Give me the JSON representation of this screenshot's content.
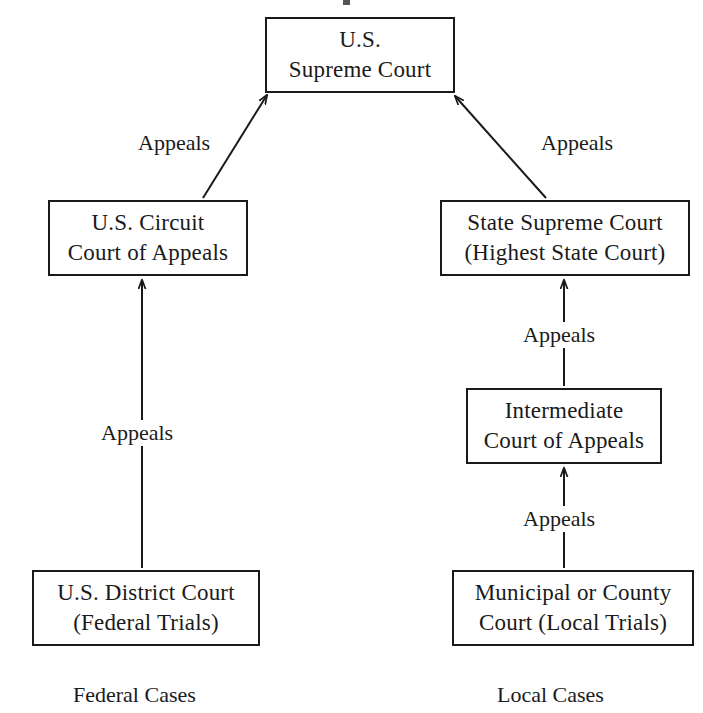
{
  "diagram": {
    "background_color": "#ffffff",
    "line_color": "#1a1a1a",
    "text_color": "#1a1a1a",
    "nodes": [
      {
        "id": "us-supreme-court",
        "line1": "U.S.",
        "line2": "Supreme Court",
        "x": 265,
        "y": 17,
        "w": 190,
        "h": 76
      },
      {
        "id": "us-circuit-court-of-appeals",
        "line1": "U.S. Circuit",
        "line2": "Court of Appeals",
        "x": 48,
        "y": 200,
        "w": 200,
        "h": 76
      },
      {
        "id": "state-supreme-court",
        "line1": "State Supreme Court",
        "line2": "(Highest State Court)",
        "x": 440,
        "y": 200,
        "w": 250,
        "h": 76
      },
      {
        "id": "intermediate-court-of-appeals",
        "line1": "Intermediate",
        "line2": "Court of Appeals",
        "x": 466,
        "y": 388,
        "w": 196,
        "h": 76
      },
      {
        "id": "us-district-court",
        "line1": "U.S. District Court",
        "line2": "(Federal Trials)",
        "x": 32,
        "y": 570,
        "w": 228,
        "h": 76
      },
      {
        "id": "municipal-or-county-court",
        "line1": "Municipal or County",
        "line2": "Court (Local Trials)",
        "x": 452,
        "y": 570,
        "w": 242,
        "h": 76
      }
    ],
    "edges": [
      {
        "id": "circuit-to-supreme",
        "label": "Appeals",
        "from": "us-circuit-court-of-appeals",
        "to": "us-supreme-court",
        "x1": 203,
        "y1": 198,
        "x2": 267,
        "y2": 95,
        "label_x": 133,
        "label_y": 130
      },
      {
        "id": "state-supreme-to-supreme",
        "label": "Appeals",
        "from": "state-supreme-court",
        "to": "us-supreme-court",
        "x1": 546,
        "y1": 198,
        "x2": 455,
        "y2": 96,
        "label_x": 536,
        "label_y": 130
      },
      {
        "id": "district-to-circuit",
        "label": "Appeals",
        "from": "us-district-court",
        "to": "us-circuit-court-of-appeals",
        "x1": 142,
        "y1": 568,
        "x2": 142,
        "y2": 280,
        "label_x": 96,
        "label_y": 420
      },
      {
        "id": "intermediate-to-state-supreme",
        "label": "Appeals",
        "from": "intermediate-court-of-appeals",
        "to": "state-supreme-court",
        "x1": 564,
        "y1": 386,
        "x2": 564,
        "y2": 280,
        "label_x": 518,
        "label_y": 322
      },
      {
        "id": "municipal-to-intermediate",
        "label": "Appeals",
        "from": "municipal-or-county-court",
        "to": "intermediate-court-of-appeals",
        "x1": 564,
        "y1": 568,
        "x2": 564,
        "y2": 468,
        "label_x": 518,
        "label_y": 506
      }
    ],
    "captions": [
      {
        "id": "federal-cases",
        "text": "Federal Cases",
        "x": 73,
        "y": 684
      },
      {
        "id": "local-cases",
        "text": "Local Cases",
        "x": 497,
        "y": 684
      }
    ]
  }
}
